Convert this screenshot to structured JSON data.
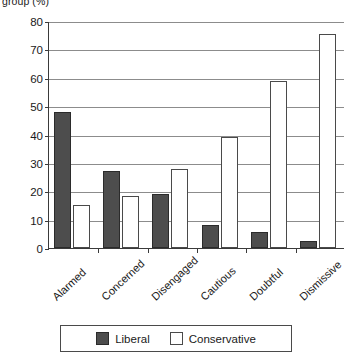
{
  "chart_data": {
    "type": "bar",
    "title": "group (%)",
    "xlabel": "",
    "ylabel": "group (%)",
    "ylim": [
      0,
      80
    ],
    "yticks": [
      0,
      10,
      20,
      30,
      40,
      50,
      60,
      70,
      80
    ],
    "grid": true,
    "legend_position": "bottom",
    "categories": [
      "Alarmed",
      "Concerned",
      "Disengaged",
      "Cautious",
      "Doubtful",
      "Dismissive"
    ],
    "series": [
      {
        "name": "Liberal",
        "color": "#4d4d4d",
        "values": [
          48,
          27,
          19,
          8,
          5.5,
          2.5
        ]
      },
      {
        "name": "Conservative",
        "color": "#ffffff",
        "values": [
          15,
          18.5,
          28,
          39,
          59,
          75.5
        ]
      }
    ]
  },
  "legend": {
    "items": [
      {
        "label": "Liberal",
        "swatch": "liberal"
      },
      {
        "label": "Conservative",
        "swatch": "conservative"
      }
    ]
  }
}
